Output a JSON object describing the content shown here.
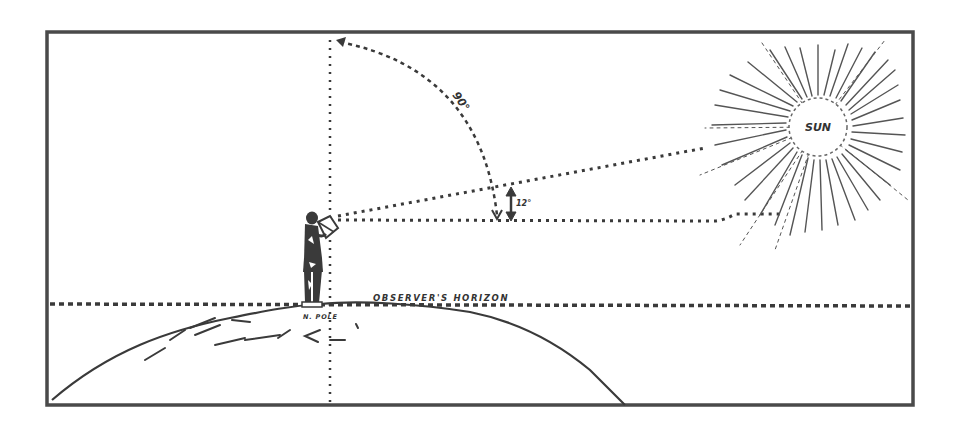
{
  "diagram": {
    "labels": {
      "sun": "SUN",
      "arc_angle": "90°",
      "altitude_angle": "12°",
      "horizon": "OBSERVER'S HORIZON",
      "pole": "N. POLE"
    },
    "elements": [
      {
        "id": "frame",
        "kind": "border-rectangle"
      },
      {
        "id": "earth",
        "kind": "curved-earth-surface"
      },
      {
        "id": "observer",
        "kind": "human-figure-with-sextant"
      },
      {
        "id": "zenith-line",
        "kind": "vertical-dotted-line"
      },
      {
        "id": "quadrant-arc",
        "kind": "dotted-arc",
        "label": "90°"
      },
      {
        "id": "sight-line-to-sun",
        "kind": "dotted-line"
      },
      {
        "id": "level-line",
        "kind": "dotted-line"
      },
      {
        "id": "altitude-arrow",
        "kind": "double-arrow",
        "label": "12°"
      },
      {
        "id": "horizon-line",
        "kind": "dotted-line",
        "label": "OBSERVER'S HORIZON"
      },
      {
        "id": "sun",
        "kind": "radiating-sun",
        "label": "SUN"
      }
    ],
    "colors": {
      "ink": "#3a3a3a",
      "paper": "#ffffff"
    }
  }
}
